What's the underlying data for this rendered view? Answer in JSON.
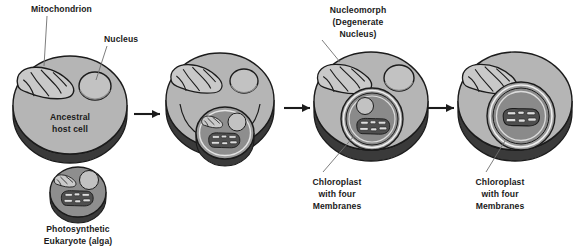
{
  "figure": {
    "background_color": "#ffffff",
    "text_color": "#1b1b1b"
  },
  "palette": {
    "cytoplasm": "#b5b5b5",
    "cytoplasm_rim": "#3a3a3a",
    "cytoplasm_rim_light": "#5e5e5e",
    "organelle_light": "#c9c9c9",
    "organelle_mid": "#9a9a9a",
    "organelle_dark": "#4a4a4a",
    "chloroplast_body": "#6e6e6e",
    "chloroplast_dark": "#2f2f2f",
    "thylakoid": "#d8d8d8",
    "outline": "#1b1b1b",
    "leader_line": "#6f6f6f",
    "alga_cytoplasm": "#8e8e8e"
  },
  "labels": {
    "mitochondrion": "Mitochondrion",
    "nucleus": "Nucleus",
    "ancestral_host_cell_line1": "Ancestral",
    "ancestral_host_cell_line2": "host cell",
    "photosynthetic_line1": "Photosynthetic",
    "photosynthetic_line2": "Eukaryote (alga)",
    "nucleomorph_line1": "Nucleomorph",
    "nucleomorph_line2": "(Degenerate",
    "nucleomorph_line3": "Nucleus)",
    "chloroplast3_line1": "Chloroplast",
    "chloroplast3_line2": "with four",
    "chloroplast3_line3": "Membranes",
    "chloroplast4_line1": "Chloroplast",
    "chloroplast4_line2": "with four",
    "chloroplast4_line3": "Membranes"
  },
  "stages": [
    {
      "id": "stage-1",
      "name": "ancestral-host-cell",
      "order": 1,
      "caption": "Ancestral host cell",
      "organelles": [
        "mitochondrion",
        "nucleus"
      ]
    },
    {
      "id": "stage-2",
      "name": "engulfment",
      "order": 2,
      "caption": "",
      "organelles": [
        "mitochondrion",
        "nucleus",
        "engulfed-alga"
      ]
    },
    {
      "id": "stage-3",
      "name": "nucleomorph-stage",
      "order": 3,
      "caption": "Chloroplast with four Membranes",
      "organelles": [
        "mitochondrion",
        "nucleus",
        "nucleomorph",
        "chloroplast-four-membranes"
      ]
    },
    {
      "id": "stage-4",
      "name": "nucleomorph-lost",
      "order": 4,
      "caption": "Chloroplast with four Membranes",
      "organelles": [
        "mitochondrion",
        "chloroplast-four-membranes"
      ]
    }
  ],
  "inset": {
    "id": "alga-cell",
    "name": "photosynthetic-eukaryote-alga",
    "caption": "Photosynthetic Eukaryote (alga)",
    "organelles": [
      "mitochondrion",
      "nucleus",
      "chloroplast"
    ]
  },
  "arrows": [
    {
      "name": "arrow-1-to-2",
      "from": "stage-1",
      "to": "stage-2"
    },
    {
      "name": "arrow-2-to-3",
      "from": "stage-2",
      "to": "stage-3"
    },
    {
      "name": "arrow-3-to-4",
      "from": "stage-3",
      "to": "stage-4"
    }
  ]
}
